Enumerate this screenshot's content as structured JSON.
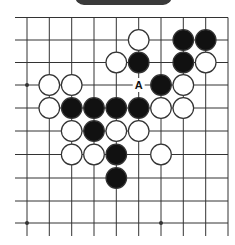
{
  "title_badge": {
    "label": ""
  },
  "board": {
    "columns": 10,
    "rows": 10,
    "col_x": [
      27,
      49.3,
      71.7,
      94,
      116.3,
      138.7,
      161,
      183.3,
      205.7,
      228
    ],
    "row_y": [
      17.5,
      40,
      62.5,
      85,
      108,
      131,
      154.5,
      178,
      201,
      223
    ],
    "edges": {
      "top": true,
      "right": true,
      "left": false,
      "bottom": false
    },
    "line_color": "#333333",
    "star_points": [
      {
        "col": 0,
        "row": 3
      },
      {
        "col": 0,
        "row": 9
      },
      {
        "col": 6,
        "row": 9
      }
    ],
    "stones": [
      {
        "color": "white",
        "col": 5,
        "row": 1
      },
      {
        "color": "black",
        "col": 7,
        "row": 1
      },
      {
        "color": "black",
        "col": 8,
        "row": 1
      },
      {
        "color": "white",
        "col": 4,
        "row": 2
      },
      {
        "color": "black",
        "col": 5,
        "row": 2
      },
      {
        "color": "black",
        "col": 7,
        "row": 2
      },
      {
        "color": "white",
        "col": 8,
        "row": 2
      },
      {
        "color": "white",
        "col": 1,
        "row": 3
      },
      {
        "color": "white",
        "col": 2,
        "row": 3
      },
      {
        "color": "black",
        "col": 6,
        "row": 3
      },
      {
        "color": "white",
        "col": 7,
        "row": 3
      },
      {
        "color": "white",
        "col": 1,
        "row": 4
      },
      {
        "color": "black",
        "col": 2,
        "row": 4
      },
      {
        "color": "black",
        "col": 3,
        "row": 4
      },
      {
        "color": "black",
        "col": 4,
        "row": 4
      },
      {
        "color": "black",
        "col": 5,
        "row": 4
      },
      {
        "color": "white",
        "col": 6,
        "row": 4
      },
      {
        "color": "white",
        "col": 7,
        "row": 4
      },
      {
        "color": "white",
        "col": 2,
        "row": 5
      },
      {
        "color": "black",
        "col": 3,
        "row": 5
      },
      {
        "color": "white",
        "col": 4,
        "row": 5
      },
      {
        "color": "white",
        "col": 5,
        "row": 5
      },
      {
        "color": "white",
        "col": 2,
        "row": 6
      },
      {
        "color": "white",
        "col": 3,
        "row": 6
      },
      {
        "color": "black",
        "col": 4,
        "row": 6
      },
      {
        "color": "white",
        "col": 6,
        "row": 6
      },
      {
        "color": "black",
        "col": 4,
        "row": 7
      }
    ],
    "markers": [
      {
        "label": "A",
        "col": 5,
        "row": 3
      }
    ],
    "colors": {
      "black": "#111111",
      "white": "#ffffff",
      "stone_outline": "#333333"
    }
  }
}
